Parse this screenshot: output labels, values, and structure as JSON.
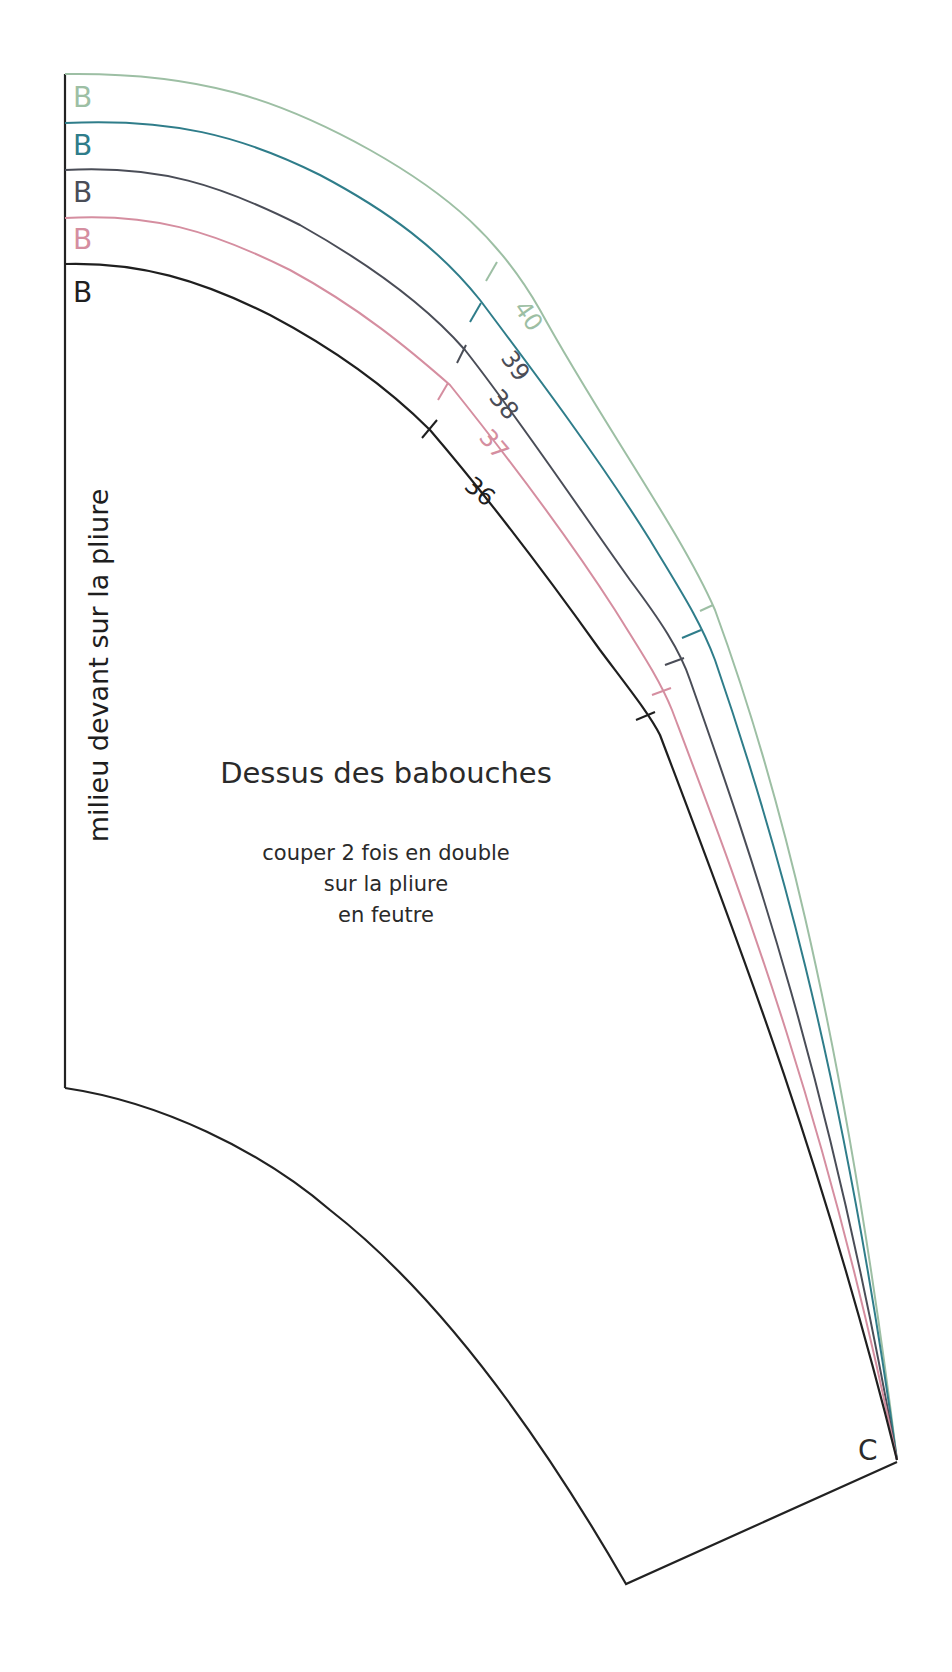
{
  "pattern": {
    "title": "Dessus des babouches",
    "instructions": [
      "couper 2 fois en double",
      "sur la pliure",
      "en feutre"
    ],
    "fold_label": "milieu devant  sur la pliure",
    "corner_label": "C",
    "point_label": "B"
  },
  "sizes": [
    {
      "size": "40",
      "label": "40",
      "point": "B",
      "color": "#9dbfa4"
    },
    {
      "size": "39",
      "label": "39",
      "point": "B",
      "color": "#2f7d8a"
    },
    {
      "size": "38",
      "label": "38",
      "point": "B",
      "color": "#4a4d57"
    },
    {
      "size": "37",
      "label": "37",
      "point": "B",
      "color": "#d58ea0"
    },
    {
      "size": "36",
      "label": "36",
      "point": "B",
      "color": "#1f1f1f"
    }
  ],
  "colors": {
    "outline": "#222222",
    "size_40": "#9dbfa4",
    "size_39": "#2f7d8a",
    "size_38": "#4a4d57",
    "size_37": "#d58ea0",
    "size_36": "#1f1f1f"
  }
}
